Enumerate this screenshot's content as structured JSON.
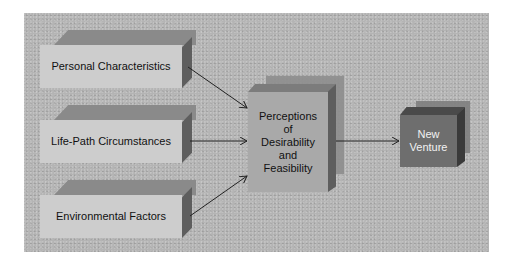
{
  "diagram": {
    "inputs": [
      {
        "label": "Personal Characteristics"
      },
      {
        "label": "Life-Path Circumstances"
      },
      {
        "label": "Environmental Factors"
      }
    ],
    "center": {
      "lines": [
        "Perceptions",
        "of",
        "Desirability",
        "and",
        "Feasibility"
      ]
    },
    "output": {
      "lines": [
        "New",
        "Venture"
      ]
    },
    "colors": {
      "background": "#b4b4b4",
      "input_face": "#cdcdcd",
      "center_face": "#a9a9a9",
      "output_face": "#6e6e6e",
      "arrow": "#222222"
    }
  }
}
